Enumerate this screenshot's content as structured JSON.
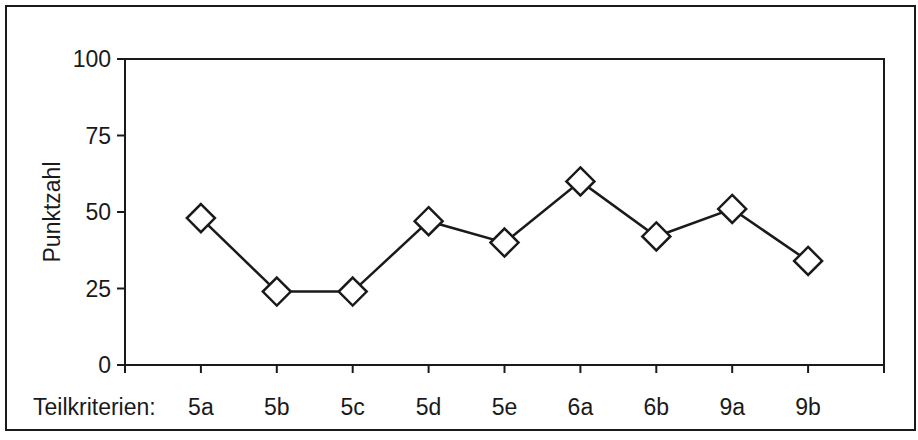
{
  "chart_data": {
    "type": "line",
    "title": "",
    "xlabel": "Teilkriterien:",
    "ylabel": "Punktzahl",
    "categories": [
      "5a",
      "5b",
      "5c",
      "5d",
      "5e",
      "6a",
      "6b",
      "9a",
      "9b"
    ],
    "series": [
      {
        "name": "Punktzahl",
        "marker": "diamond-open",
        "values": [
          48,
          24,
          24,
          47,
          40,
          60,
          42,
          51,
          34
        ]
      }
    ],
    "ylim": [
      0,
      100
    ],
    "yticks": [
      0,
      25,
      50,
      75,
      100
    ],
    "grid": false,
    "legend": "none"
  },
  "colors": {
    "line": "#1a1a1a",
    "marker_fill": "#ffffff",
    "frame": "#1a1a1a",
    "background": "#ffffff"
  }
}
